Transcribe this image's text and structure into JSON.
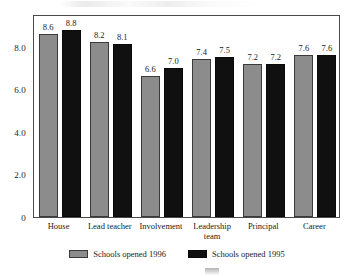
{
  "chart_data": {
    "type": "bar",
    "title": "",
    "subtitle": "",
    "xlabel": "",
    "ylabel": "",
    "ylim": [
      0,
      9.53
    ],
    "grid": false,
    "legend_position": "bottom",
    "categories": [
      "House",
      "Lead teacher",
      "Involvement",
      "Leadership\nteam",
      "Principal",
      "Career"
    ],
    "yticks": [
      "0",
      "2.0",
      "4.0",
      "6.0",
      "8.0"
    ],
    "ytick_values": [
      0,
      2.0,
      4.0,
      6.0,
      8.0
    ],
    "series": [
      {
        "name": "Schools opened 1996",
        "color": "#8c8c8c",
        "values": [
          8.6,
          8.2,
          6.6,
          7.4,
          7.2,
          7.6
        ],
        "labels": [
          "8.6",
          "8.2",
          "6.6",
          "7.4",
          "7.2",
          "7.6"
        ]
      },
      {
        "name": "Schools opened 1995",
        "color": "#101010",
        "values": [
          8.8,
          8.1,
          7.0,
          7.5,
          7.2,
          7.6
        ],
        "labels": [
          "8.8",
          "8.1",
          "7.0",
          "7.5",
          "7.2",
          "7.6"
        ]
      }
    ]
  },
  "legend": {
    "items": [
      {
        "label": "Schools opened 1996",
        "swatch": "gray-swatch"
      },
      {
        "label": "Schools opened 1995",
        "swatch": "black-swatch"
      }
    ]
  },
  "artifacts": {
    "top_smudge": "",
    "bottom_smudge": ""
  }
}
